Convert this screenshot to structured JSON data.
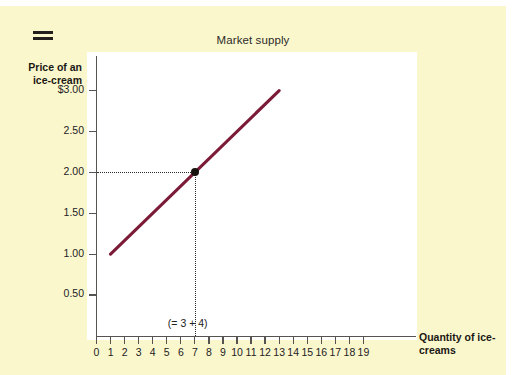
{
  "header": {
    "menu_icon": "hamburger-icon",
    "title": "Market supply"
  },
  "chart_data": {
    "type": "line",
    "title": "Market supply",
    "xlabel": "Quantity of ice-creams",
    "ylabel": "Price of an ice-cream",
    "xlim": [
      0,
      19
    ],
    "ylim": [
      0,
      3.25
    ],
    "grid": false,
    "legend": null,
    "x_ticks": [
      "0",
      "1",
      "2",
      "3",
      "4",
      "5",
      "6",
      "7",
      "8",
      "9",
      "10",
      "11",
      "12",
      "13",
      "14",
      "15",
      "16",
      "17",
      "18",
      "19"
    ],
    "x_tick_values": [
      0,
      1,
      2,
      3,
      4,
      5,
      6,
      7,
      8,
      9,
      10,
      11,
      12,
      13,
      14,
      15,
      16,
      17,
      18,
      19
    ],
    "y_ticks": [
      "0.50",
      "1.00",
      "1.50",
      "2.00",
      "2.50",
      "$3.00"
    ],
    "y_tick_values": [
      0.5,
      1.0,
      1.5,
      2.0,
      2.5,
      3.0
    ],
    "series": [
      {
        "name": "Market supply",
        "color": "#7b1b37",
        "x": [
          1,
          13
        ],
        "values": [
          1.0,
          3.0
        ]
      }
    ],
    "points": [
      {
        "name": "equilibrium-point",
        "x": 7,
        "y": 2.0,
        "color": "#17140f",
        "annotation": "(= 3 + 4)"
      }
    ],
    "guides": [
      {
        "type": "horizontal",
        "y": 2.0,
        "from_x": 0,
        "to_x": 7,
        "style": "dotted"
      },
      {
        "type": "vertical",
        "x": 7,
        "from_y": 0,
        "to_y": 2.0,
        "style": "dotted"
      }
    ],
    "annotations": [
      {
        "text": "(= 3 + 4)",
        "x": 7,
        "below_axis": true
      }
    ]
  },
  "colors": {
    "page_background": "#faf7cd",
    "plot_background": "#ffffff",
    "axis": "#565450",
    "supply_line": "#7b1b37",
    "point": "#17140f",
    "text": "#23211f"
  }
}
